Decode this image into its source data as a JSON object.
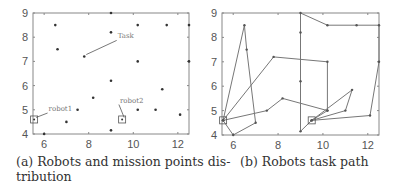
{
  "figures": [
    {
      "id": "a",
      "caption": "(a) Robots and mission points distribution",
      "caption_line1": "(a) Robots and mission points dis-",
      "caption_line2": "tribution"
    },
    {
      "id": "b",
      "caption": "(b) Robots task path"
    }
  ],
  "chart_data": [
    {
      "type": "scatter",
      "title": "(a) Robots and mission points distribution",
      "xlim": [
        5.5,
        12.5
      ],
      "ylim": [
        4,
        9
      ],
      "xticks": [
        6,
        8,
        10,
        12
      ],
      "yticks": [
        4,
        5,
        6,
        7,
        8,
        9
      ],
      "grid": false,
      "series": [
        {
          "name": "mission points",
          "marker": "dot",
          "points": [
            [
              6.5,
              8.5
            ],
            [
              9,
              9
            ],
            [
              10.2,
              8.5
            ],
            [
              11.5,
              8.5
            ],
            [
              12.5,
              8.5
            ],
            [
              9,
              8.2
            ],
            [
              6.6,
              7.5
            ],
            [
              7.8,
              7.2
            ],
            [
              10.2,
              7
            ],
            [
              12.5,
              7
            ],
            [
              9,
              6.2
            ],
            [
              11.3,
              5.85
            ],
            [
              8.2,
              5.5
            ],
            [
              7.5,
              5
            ],
            [
              10.2,
              5
            ],
            [
              11,
              5
            ],
            [
              12.1,
              4.8
            ],
            [
              7,
              4.5
            ],
            [
              9,
              4.15
            ],
            [
              6,
              4
            ]
          ]
        },
        {
          "name": "robots",
          "marker": "square",
          "points": [
            [
              5.55,
              4.6
            ],
            [
              9.5,
              4.6
            ]
          ]
        }
      ],
      "annotations": [
        {
          "text": "Task",
          "point": [
            7.8,
            7.2
          ],
          "text_pos": [
            9.3,
            7.95
          ]
        },
        {
          "text": "robot1",
          "point": [
            5.55,
            4.6
          ],
          "text_pos": [
            6.2,
            4.95
          ]
        },
        {
          "text": "robot2",
          "point": [
            9.5,
            4.6
          ],
          "text_pos": [
            9.4,
            5.3
          ]
        }
      ]
    },
    {
      "type": "line",
      "title": "(b) Robots task path",
      "xlim": [
        5.5,
        12.5
      ],
      "ylim": [
        4,
        9
      ],
      "xticks": [
        6,
        8,
        10,
        12
      ],
      "yticks": [
        4,
        5,
        6,
        7,
        8,
        9
      ],
      "grid": false,
      "series": [
        {
          "name": "robot1 path",
          "points": [
            [
              5.55,
              4.6
            ],
            [
              6.5,
              8.5
            ],
            [
              6.6,
              7.5
            ],
            [
              7,
              4.5
            ],
            [
              6,
              4
            ],
            [
              5.55,
              4.6
            ],
            [
              7.8,
              7.2
            ],
            [
              10.2,
              7
            ],
            [
              10.2,
              5
            ],
            [
              8.2,
              5.5
            ],
            [
              7.5,
              5
            ],
            [
              5.55,
              4.6
            ]
          ]
        },
        {
          "name": "robot2 path",
          "points": [
            [
              9.5,
              4.6
            ],
            [
              9,
              4.15
            ],
            [
              9,
              6.2
            ],
            [
              9,
              8.2
            ],
            [
              9,
              9
            ],
            [
              10.2,
              8.5
            ],
            [
              11.5,
              8.5
            ],
            [
              12.5,
              8.5
            ],
            [
              12.5,
              7
            ],
            [
              12.1,
              4.8
            ],
            [
              9.5,
              4.6
            ],
            [
              11,
              5
            ],
            [
              11.3,
              5.85
            ],
            [
              9.5,
              4.6
            ],
            [
              10.2,
              5
            ]
          ]
        }
      ],
      "robots": [
        [
          5.55,
          4.6
        ],
        [
          9.5,
          4.6
        ]
      ]
    }
  ]
}
